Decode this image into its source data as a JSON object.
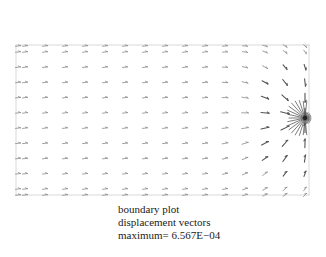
{
  "plot": {
    "type": "vector-field",
    "frame": {
      "left": 16,
      "top": 45,
      "right": 309,
      "bottom": 195
    },
    "grid": {
      "cols": 16,
      "rows": 11
    },
    "singularity": {
      "x": 305,
      "y": 118
    },
    "frame_color": "#cfcfcf",
    "arrow_color": "#555555"
  },
  "caption": {
    "line1": "boundary plot",
    "line2": "displacement vectors",
    "line3": "maximum= 6.567E−04"
  }
}
